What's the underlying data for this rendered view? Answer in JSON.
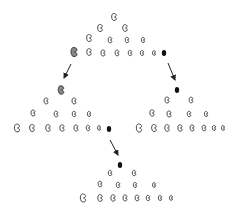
{
  "diagram": {
    "title": "",
    "colors": {
      "background": "#ffffff",
      "outline": "#333333",
      "gray_fill": "#888888",
      "black_fill": "#111111",
      "arrow": "#222222"
    },
    "pyramids": [
      {
        "id": "top",
        "beans": [
          {
            "x": 114,
            "y": 17,
            "s": 1.0
          },
          {
            "x": 100,
            "y": 28,
            "s": 1.0
          },
          {
            "x": 125,
            "y": 28,
            "s": 0.95
          },
          {
            "x": 89,
            "y": 38,
            "s": 1.0
          },
          {
            "x": 110,
            "y": 40,
            "s": 0.8
          },
          {
            "x": 127,
            "y": 40,
            "s": 0.75
          },
          {
            "x": 143,
            "y": 40,
            "s": 0.7
          },
          {
            "x": 89,
            "y": 52,
            "s": 0.95
          },
          {
            "x": 103,
            "y": 53,
            "s": 0.85
          },
          {
            "x": 117,
            "y": 53,
            "s": 0.8
          },
          {
            "x": 130,
            "y": 53,
            "s": 0.75
          },
          {
            "x": 142,
            "y": 53,
            "s": 0.7
          },
          {
            "x": 154,
            "y": 53,
            "s": 0.65
          }
        ],
        "gray": {
          "x": 74,
          "y": 52,
          "s": 1.3
        },
        "black": {
          "x": 164,
          "y": 53,
          "s": 0.55
        }
      },
      {
        "id": "left",
        "beans": [
          {
            "x": 46,
            "y": 101,
            "s": 0.85
          },
          {
            "x": 74,
            "y": 101,
            "s": 0.85
          },
          {
            "x": 33,
            "y": 113,
            "s": 0.85
          },
          {
            "x": 56,
            "y": 114,
            "s": 0.8
          },
          {
            "x": 74,
            "y": 114,
            "s": 0.75
          },
          {
            "x": 89,
            "y": 114,
            "s": 0.7
          },
          {
            "x": 17,
            "y": 128,
            "s": 1.1
          },
          {
            "x": 32,
            "y": 128,
            "s": 1.0
          },
          {
            "x": 48,
            "y": 128,
            "s": 0.95
          },
          {
            "x": 62,
            "y": 128,
            "s": 0.9
          },
          {
            "x": 76,
            "y": 128,
            "s": 0.85
          },
          {
            "x": 88,
            "y": 128,
            "s": 0.75
          },
          {
            "x": 99,
            "y": 128,
            "s": 0.65
          }
        ],
        "gray": {
          "x": 61,
          "y": 90,
          "s": 1.2
        },
        "black": {
          "x": 109,
          "y": 129,
          "s": 0.55
        }
      },
      {
        "id": "right",
        "beans": [
          {
            "x": 167,
            "y": 100,
            "s": 0.85
          },
          {
            "x": 191,
            "y": 100,
            "s": 0.8
          },
          {
            "x": 152,
            "y": 113,
            "s": 0.9
          },
          {
            "x": 169,
            "y": 114,
            "s": 0.85
          },
          {
            "x": 189,
            "y": 114,
            "s": 0.75
          },
          {
            "x": 206,
            "y": 114,
            "s": 0.7
          },
          {
            "x": 139,
            "y": 128,
            "s": 1.15
          },
          {
            "x": 154,
            "y": 128,
            "s": 1.0
          },
          {
            "x": 167,
            "y": 128,
            "s": 0.95
          },
          {
            "x": 180,
            "y": 128,
            "s": 0.9
          },
          {
            "x": 192,
            "y": 128,
            "s": 0.85
          },
          {
            "x": 204,
            "y": 128,
            "s": 0.8
          },
          {
            "x": 214,
            "y": 128,
            "s": 0.7
          },
          {
            "x": 223,
            "y": 128,
            "s": 0.65
          }
        ],
        "black": {
          "x": 177,
          "y": 90,
          "s": 0.55
        }
      },
      {
        "id": "bottom",
        "beans": [
          {
            "x": 110,
            "y": 173,
            "s": 0.75
          },
          {
            "x": 134,
            "y": 173,
            "s": 0.75
          },
          {
            "x": 100,
            "y": 184,
            "s": 0.8
          },
          {
            "x": 118,
            "y": 185,
            "s": 0.75
          },
          {
            "x": 135,
            "y": 185,
            "s": 0.7
          },
          {
            "x": 154,
            "y": 185,
            "s": 0.65
          },
          {
            "x": 83,
            "y": 198,
            "s": 1.15
          },
          {
            "x": 100,
            "y": 198,
            "s": 0.95
          },
          {
            "x": 113,
            "y": 198,
            "s": 0.9
          },
          {
            "x": 125,
            "y": 198,
            "s": 0.85
          },
          {
            "x": 137,
            "y": 198,
            "s": 0.8
          },
          {
            "x": 148,
            "y": 198,
            "s": 0.75
          },
          {
            "x": 160,
            "y": 198,
            "s": 0.7
          },
          {
            "x": 171,
            "y": 198,
            "s": 0.65
          }
        ],
        "black": {
          "x": 120,
          "y": 165,
          "s": 0.55
        }
      }
    ],
    "arrows": [
      {
        "name": "arrow-top-to-left",
        "x1": 71,
        "y1": 64,
        "x2": 64,
        "y2": 78
      },
      {
        "name": "arrow-top-to-right",
        "x1": 168,
        "y1": 63,
        "x2": 175,
        "y2": 80
      },
      {
        "name": "arrow-left-to-bottom",
        "x1": 110,
        "y1": 140,
        "x2": 118,
        "y2": 155
      }
    ]
  }
}
